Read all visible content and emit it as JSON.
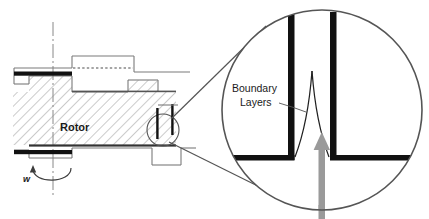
{
  "figure": {
    "type": "engineering-cross-section-diagram",
    "title_visible": false,
    "background_color": "#ffffff"
  },
  "cross_section": {
    "label_rotor": "Rotor",
    "label_omega": "w",
    "omega_meaning": "angular-velocity",
    "centerline_style": "dash-dot",
    "hatch_color": "#8c8c8c",
    "outline_color": "#7a7a7a",
    "disk_color": "#111111",
    "detail_circle": {
      "cx": 163,
      "cy": 130,
      "r": 16,
      "stroke": "#555555"
    }
  },
  "magnified_inset": {
    "label_boundary_layers_line1": "Boundary",
    "label_boundary_layers_line2": "Layers",
    "circle": {
      "cx": 322,
      "cy": 110,
      "r": 100,
      "stroke": "#555555"
    },
    "wall_color": "#111111",
    "boundary_layer_curve_color": "#222222",
    "flow_arrow": {
      "color": "#9a9a9a",
      "direction": "up",
      "meaning": "flow-inlet"
    },
    "leader_line_color": "#555555"
  },
  "colors": {
    "black": "#111111",
    "gray_arrow": "#9a9a9a",
    "gray_outline": "#7a7a7a",
    "gray_hatch": "#8c8c8c",
    "leader": "#555555",
    "text": "#1a1a1a"
  }
}
